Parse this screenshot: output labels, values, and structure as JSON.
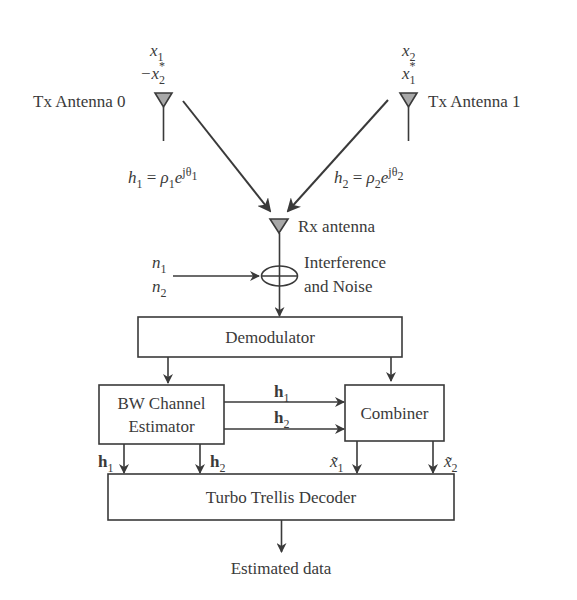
{
  "diagram": {
    "type": "block-diagram",
    "tx_antenna_0": {
      "label": "Tx Antenna 0",
      "symbols": [
        "x1",
        "-x2*"
      ],
      "channel": "h1 = ρ1 e^{jθ1}"
    },
    "tx_antenna_1": {
      "label": "Tx Antenna 1",
      "symbols": [
        "x2",
        "x1*"
      ],
      "channel": "h2 = ρ2 e^{jθ2}"
    },
    "rx_antenna": {
      "label": "Rx antenna"
    },
    "noise": {
      "inputs": [
        "n1",
        "n2"
      ],
      "label_line1": "Interference",
      "label_line2": "and Noise"
    },
    "blocks": {
      "demodulator": "Demodulator",
      "channel_estimator_line1": "BW Channel",
      "channel_estimator_line2": "Estimator",
      "combiner": "Combiner",
      "decoder": "Turbo Trellis Decoder"
    },
    "signals": {
      "est_to_combiner": [
        "h1",
        "h2"
      ],
      "est_to_decoder": [
        "h1",
        "h2"
      ],
      "combiner_to_decoder": [
        "x̃1",
        "x̃2"
      ]
    },
    "output": "Estimated data"
  }
}
